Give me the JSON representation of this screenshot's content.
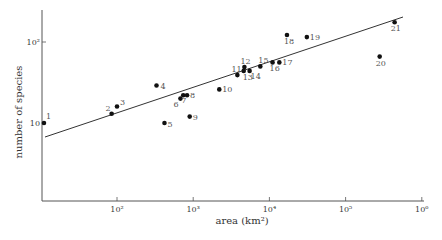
{
  "chart_data": {
    "type": "scatter",
    "title": "",
    "xlabel": "area (km²)",
    "ylabel": "number of species",
    "xscale": "log",
    "yscale": "log",
    "xlim": [
      10,
      1000000
    ],
    "ylim": [
      5,
      200
    ],
    "grid": false,
    "legend": null,
    "x_ticks": [
      {
        "value": 100,
        "label": "10²"
      },
      {
        "value": 1000,
        "label": "10³"
      },
      {
        "value": 10000,
        "label": "10⁴"
      },
      {
        "value": 100000,
        "label": "10⁵"
      },
      {
        "value": 1000000,
        "label": "10⁶"
      }
    ],
    "y_ticks": [
      {
        "value": 10,
        "label": "10"
      },
      {
        "value": 100,
        "label": "10²"
      }
    ],
    "points": [
      {
        "label": "1",
        "x": 11,
        "y": 10
      },
      {
        "label": "2",
        "x": 85,
        "y": 13
      },
      {
        "label": "3",
        "x": 100,
        "y": 16
      },
      {
        "label": "4",
        "x": 330,
        "y": 29
      },
      {
        "label": "5",
        "x": 420,
        "y": 10
      },
      {
        "label": "6",
        "x": 680,
        "y": 20
      },
      {
        "label": "7",
        "x": 740,
        "y": 22
      },
      {
        "label": "8",
        "x": 830,
        "y": 22
      },
      {
        "label": "9",
        "x": 900,
        "y": 12
      },
      {
        "label": "10",
        "x": 2200,
        "y": 26
      },
      {
        "label": "11",
        "x": 3800,
        "y": 39
      },
      {
        "label": "12",
        "x": 4700,
        "y": 49
      },
      {
        "label": "13",
        "x": 4600,
        "y": 44
      },
      {
        "label": "14",
        "x": 5500,
        "y": 44
      },
      {
        "label": "15",
        "x": 7600,
        "y": 50
      },
      {
        "label": "16",
        "x": 11000,
        "y": 56
      },
      {
        "label": "17",
        "x": 13500,
        "y": 56
      },
      {
        "label": "18",
        "x": 17000,
        "y": 122
      },
      {
        "label": "19",
        "x": 31000,
        "y": 115
      },
      {
        "label": "20",
        "x": 280000,
        "y": 66
      },
      {
        "label": "21",
        "x": 440000,
        "y": 175
      }
    ],
    "fit_line": {
      "x": [
        11,
        560000
      ],
      "y": [
        7,
        195
      ]
    }
  }
}
